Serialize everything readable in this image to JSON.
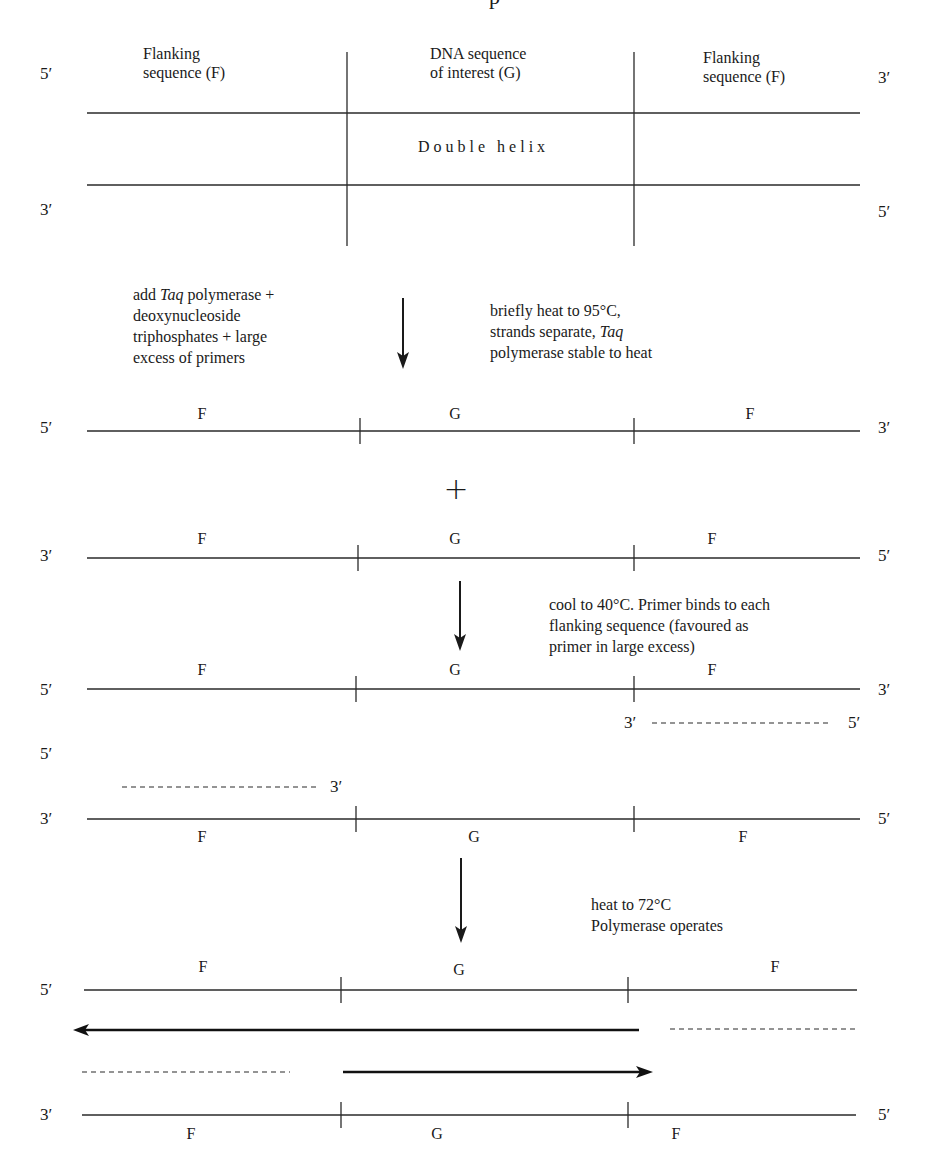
{
  "header_fragment": "p",
  "panel1": {
    "end_top_left": "5′",
    "end_top_right": "3′",
    "end_bottom_left": "3′",
    "end_bottom_right": "5′",
    "col_left_line1": "Flanking",
    "col_left_line2": "sequence (F)",
    "col_mid_line1": "DNA sequence",
    "col_mid_line2": "of interest (G)",
    "col_right_line1": "Flanking",
    "col_right_line2": "sequence (F)",
    "center_label": "Double helix"
  },
  "step1": {
    "left_note": [
      "add ",
      "Taq",
      " polymerase +",
      "deoxynucleoside",
      "triphosphates + large",
      "excess of primers"
    ],
    "right_note": [
      "briefly heat to 95°C,",
      "strands separate, ",
      "Taq",
      "polymerase stable to heat"
    ]
  },
  "panel2": {
    "strand_a": {
      "end_left": "5′",
      "end_right": "3′",
      "seg_left": "F",
      "seg_mid": "G",
      "seg_right": "F"
    },
    "plus": "+",
    "strand_b": {
      "end_left": "3′",
      "end_right": "5′",
      "seg_left": "F",
      "seg_mid": "G",
      "seg_right": "F"
    }
  },
  "step2": {
    "note": [
      "cool to 40°C. Primer binds to each",
      "flanking sequence (favoured as",
      "primer in large excess)"
    ]
  },
  "panel3": {
    "strand_a": {
      "end_left": "5′",
      "end_right": "3′",
      "seg_left": "F",
      "seg_mid": "G",
      "seg_right": "F"
    },
    "primer_a": {
      "end_left": "3′",
      "end_right": "5′"
    },
    "primer_b": {
      "end_left": "5′",
      "end_right": "3′"
    },
    "strand_b": {
      "end_left": "3′",
      "end_right": "5′",
      "seg_left": "F",
      "seg_mid": "G",
      "seg_right": "F"
    }
  },
  "step3": {
    "note": [
      "heat to 72°C",
      "Polymerase operates"
    ]
  },
  "panel4": {
    "strand_a": {
      "end_left": "5′",
      "seg_left": "F",
      "seg_mid": "G",
      "seg_right": "F"
    },
    "strand_b": {
      "end_left": "3′",
      "end_right": "5′",
      "seg_left": "F",
      "seg_mid": "G",
      "seg_right": "F"
    }
  }
}
